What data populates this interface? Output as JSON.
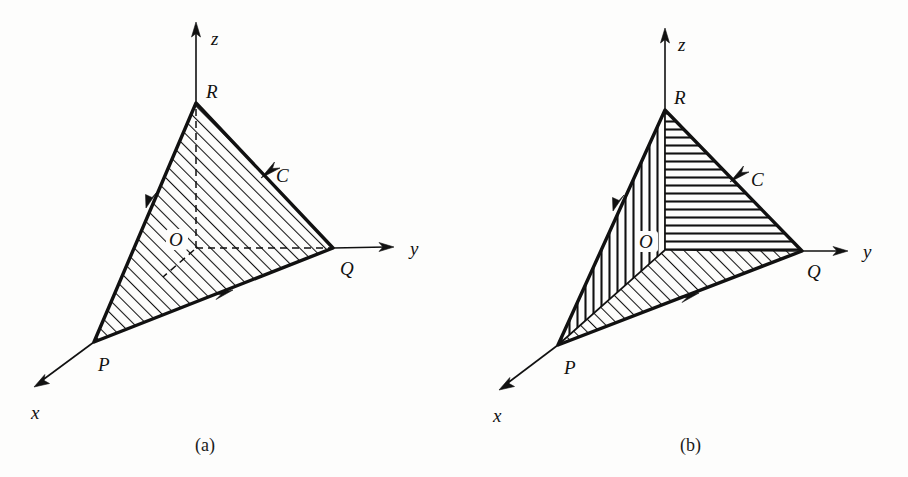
{
  "figure": {
    "kind": "vector-calculus-oriented-surface-diagram",
    "background_color": "#fdfdfc",
    "ink_color": "#111111",
    "panels": [
      {
        "id": "a",
        "caption": "(a)",
        "caption_pos": [
          205,
          445
        ],
        "shading": "uniform diagonal hatch over whole triangle PQR",
        "axes": [
          {
            "name": "z",
            "label": "z",
            "label_pos": [
              215,
              40
            ],
            "from": [
              196,
              250
            ],
            "to": [
              196,
              25
            ]
          },
          {
            "name": "y",
            "label": "y",
            "label_pos": [
              415,
              254
            ],
            "from": [
              196,
              248
            ],
            "to": [
              392,
              247
            ]
          },
          {
            "name": "x",
            "label": "x",
            "label_pos": [
              36,
              415
            ],
            "from": [
              196,
              248
            ],
            "to": [
              36,
              386
            ]
          }
        ],
        "vertices": [
          {
            "name": "R",
            "label": "R",
            "pos": [
              196,
              103
            ],
            "label_pos": [
              211,
              96
            ]
          },
          {
            "name": "Q",
            "label": "Q",
            "pos": [
              333,
              248
            ],
            "label_pos": [
              345,
              270
            ]
          },
          {
            "name": "P",
            "label": "P",
            "pos": [
              94,
              342
            ],
            "label_pos": [
              103,
              366
            ]
          },
          {
            "name": "O",
            "label": "O",
            "pos": [
              196,
              248
            ],
            "label_pos": [
              175,
              244
            ]
          }
        ],
        "curve": {
          "name": "C",
          "label": "C",
          "label_pos": [
            281,
            176
          ],
          "orientation": "counterclockwise: R to P, P to Q, Q to R"
        },
        "edge_arrows": [
          {
            "edge": "RP",
            "at": [
              150,
              200
            ],
            "direction": "toward P"
          },
          {
            "edge": "PQ",
            "at": [
              222,
              293
            ],
            "direction": "toward Q"
          },
          {
            "edge": "QR",
            "at": [
              269,
              172
            ],
            "direction": "toward R"
          }
        ],
        "hidden_segments": [
          {
            "from": [
              196,
              248
            ],
            "to": [
              333,
              248
            ],
            "note": "y-axis inside triangle"
          },
          {
            "from": [
              196,
              248
            ],
            "to": [
              196,
              103
            ],
            "note": "z-axis inside triangle"
          },
          {
            "from": [
              196,
              248
            ],
            "to": [
              163,
              277
            ],
            "note": "x-axis stub inside triangle"
          }
        ]
      },
      {
        "id": "b",
        "caption": "(b)",
        "caption_pos": [
          690,
          445
        ],
        "shading": "triangle split at O into three sub-triangles with different hatch directions",
        "axes": [
          {
            "name": "z",
            "label": "z",
            "label_pos": [
              682,
              46
            ],
            "from": [
              665,
              250
            ],
            "to": [
              665,
              30
            ]
          },
          {
            "name": "y",
            "label": "y",
            "label_pos": [
              868,
              256
            ],
            "from": [
              665,
              250
            ],
            "to": [
              846,
              250
            ]
          },
          {
            "name": "x",
            "label": "x",
            "label_pos": [
              498,
              418
            ],
            "from": [
              665,
              250
            ],
            "to": [
              500,
              389
            ]
          }
        ],
        "vertices": [
          {
            "name": "R",
            "label": "R",
            "pos": [
              665,
              110
            ],
            "label_pos": [
              679,
              100
            ]
          },
          {
            "name": "Q",
            "label": "Q",
            "pos": [
              802,
              251
            ],
            "label_pos": [
              812,
              272
            ]
          },
          {
            "name": "P",
            "label": "P",
            "pos": [
              558,
              345
            ],
            "label_pos": [
              570,
              368
            ]
          },
          {
            "name": "O",
            "label": "O",
            "pos": [
              665,
              250
            ],
            "label_pos": [
              645,
              245
            ]
          }
        ],
        "curve": {
          "name": "C",
          "label": "C",
          "label_pos": [
            757,
            176
          ],
          "orientation": "counterclockwise: R to P, P to Q, Q to R"
        },
        "edge_arrows": [
          {
            "edge": "RP",
            "at": [
              617,
              203
            ],
            "direction": "toward P"
          },
          {
            "edge": "PQ",
            "at": [
              688,
              296
            ],
            "direction": "toward Q"
          },
          {
            "edge": "QR",
            "at": [
              738,
              176
            ],
            "direction": "toward R"
          }
        ],
        "sub_regions": [
          {
            "name": "ROQ",
            "hatch": "horizontal",
            "points": "665,110 802,251 665,250"
          },
          {
            "name": "ROP",
            "hatch": "vertical",
            "points": "665,110 665,250 558,345"
          },
          {
            "name": "POQ",
            "hatch": "diagonal",
            "points": "558,345 665,250 802,251"
          }
        ],
        "inner_segments": [
          {
            "from": [
              665,
              250
            ],
            "to": [
              665,
              110
            ],
            "note": "O to R"
          },
          {
            "from": [
              665,
              250
            ],
            "to": [
              802,
              251
            ],
            "note": "O to Q"
          },
          {
            "from": [
              665,
              250
            ],
            "to": [
              558,
              345
            ],
            "note": "O to P"
          }
        ]
      }
    ]
  }
}
